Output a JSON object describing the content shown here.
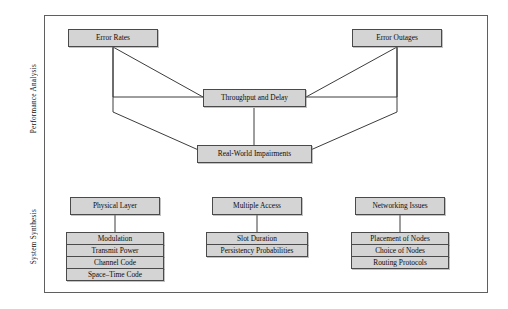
{
  "diagram": {
    "sections": [
      {
        "id": "performance-analysis",
        "label": "Performance Analysis"
      },
      {
        "id": "system-synthesis",
        "label": "System Synthesis"
      }
    ],
    "performance_analysis": {
      "error_rates": "Error Rates",
      "error_outages": "Error Outages",
      "throughput_and_delay": "Throughput and Delay",
      "real_world_impairments": "Real-World Impairments"
    },
    "system_synthesis": {
      "columns": [
        {
          "id": "physical-layer",
          "header": "Physical Layer",
          "items": [
            "Modulation",
            "Transmit Power",
            "Channel Code",
            "Space–Time Code"
          ]
        },
        {
          "id": "multiple-access",
          "header": "Multiple Access",
          "items": [
            "Slot Duration",
            "Persistency Probabilities"
          ]
        },
        {
          "id": "networking-issues",
          "header": "Networking Issues",
          "items": [
            "Placement of Nodes",
            "Choice of Nodes",
            "Routing Protocols"
          ]
        }
      ]
    },
    "colors": {
      "box_fill": "#d4d4d4",
      "box_border": "#4a4a4a",
      "frame_border": "#5f5f5f",
      "line": "#3c3c3c",
      "background": "#ffffff",
      "text": "#0d0d0d"
    }
  }
}
